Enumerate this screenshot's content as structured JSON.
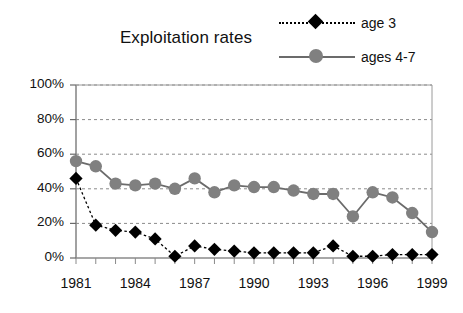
{
  "chart_data": {
    "type": "line",
    "title": "Exploitation rates",
    "xlabel": "",
    "ylabel": "",
    "grid": true,
    "legend_position": "top-right",
    "x": [
      1981,
      1982,
      1983,
      1984,
      1985,
      1986,
      1987,
      1988,
      1989,
      1990,
      1991,
      1992,
      1993,
      1994,
      1995,
      1996,
      1997,
      1998,
      1999
    ],
    "xtick_labels": [
      "1981",
      "1984",
      "1987",
      "1990",
      "1993",
      "1996",
      "1999"
    ],
    "xtick_values": [
      1981,
      1984,
      1987,
      1990,
      1993,
      1996,
      1999
    ],
    "ytick_labels": [
      "0%",
      "20%",
      "40%",
      "60%",
      "80%",
      "100%"
    ],
    "ytick_values": [
      0,
      20,
      40,
      60,
      80,
      100
    ],
    "ylim": [
      0,
      100
    ],
    "xlim": [
      1981,
      1999
    ],
    "series": [
      {
        "name": "age 3",
        "color": "#000000",
        "marker": "diamond",
        "line_style": "dotted",
        "values": [
          46,
          19,
          16,
          15,
          11,
          1,
          7,
          5,
          4,
          3,
          3,
          3,
          3,
          7,
          1,
          1,
          2,
          2,
          2
        ]
      },
      {
        "name": "ages 4-7",
        "color": "#808080",
        "marker": "circle",
        "line_style": "solid",
        "values": [
          56,
          53,
          43,
          42,
          43,
          40,
          46,
          38,
          42,
          41,
          41,
          39,
          37,
          37,
          24,
          38,
          35,
          26,
          15
        ]
      }
    ]
  },
  "legend": {
    "items": [
      {
        "label": "age 3"
      },
      {
        "label": "ages 4-7"
      }
    ]
  }
}
